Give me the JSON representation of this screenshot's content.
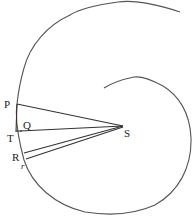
{
  "diagram": {
    "type": "geometric-orbit-spiral",
    "stroke_color": "#555555",
    "background": "#ffffff",
    "labels": {
      "P": "P",
      "Q": "Q",
      "T": "T",
      "R": "R",
      "r": "r",
      "S": "S"
    },
    "points": {
      "P": [
        17,
        104
      ],
      "Q": [
        20,
        127
      ],
      "T": [
        18,
        132
      ],
      "R": [
        22,
        156
      ],
      "r": [
        24,
        163
      ],
      "S": [
        123,
        126
      ]
    },
    "segments": [
      {
        "from": "P",
        "to": "S"
      },
      {
        "from": "Q",
        "to": "S"
      },
      {
        "from": "R",
        "to": "S"
      },
      {
        "from": "r",
        "to": "S"
      },
      {
        "from": "P",
        "to": "T"
      }
    ]
  }
}
